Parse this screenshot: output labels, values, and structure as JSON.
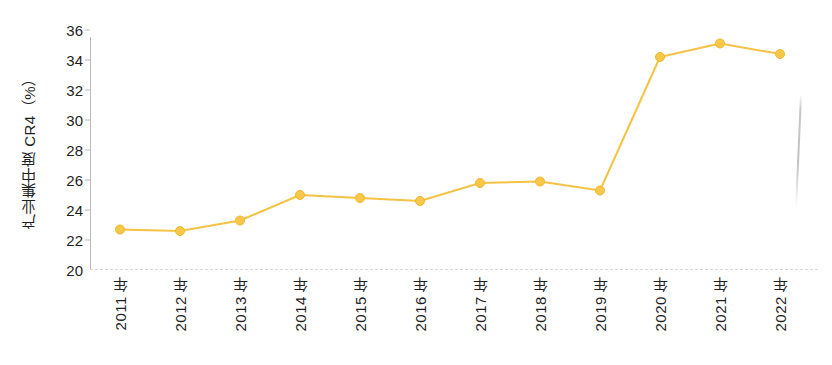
{
  "chart_data": {
    "type": "line",
    "title": "",
    "subtitle": "",
    "xlabel": "",
    "ylabel": "产业集中度 CR4（%）",
    "categories": [
      "2011 年",
      "2012 年",
      "2013 年",
      "2014 年",
      "2015 年",
      "2016 年",
      "2017 年",
      "2018 年",
      "2019 年",
      "2020 年",
      "2021 年",
      "2022 年"
    ],
    "values": [
      22.7,
      22.6,
      23.3,
      25.0,
      24.8,
      24.6,
      25.8,
      25.9,
      25.3,
      34.2,
      35.1,
      34.4
    ],
    "series": [
      {
        "name": "产业集中度 CR4",
        "values": [
          22.7,
          22.6,
          23.3,
          25.0,
          24.8,
          24.6,
          25.8,
          25.9,
          25.3,
          34.2,
          35.1,
          34.4
        ]
      }
    ],
    "ylim": [
      20,
      36
    ],
    "ytick_values": [
      20,
      22,
      24,
      26,
      28,
      30,
      32,
      34,
      36
    ],
    "ytick_labels": [
      "20",
      "22",
      "24",
      "26",
      "28",
      "30",
      "32",
      "34",
      "36"
    ],
    "ytick_step": 2,
    "xlim_categories": 12,
    "grid": false,
    "legend": null,
    "legend_position": "none",
    "marker": "circle",
    "marker_size": 9,
    "line_width": 2,
    "colors": {
      "line": "#F5C344",
      "marker_fill": "#F9C84A",
      "marker_edge": "#F2B72B",
      "axis": "#B9B9BD",
      "baseline": "#D8D8DC",
      "text": "#1F1F1F",
      "background": "#FFFFFF"
    },
    "annotations": []
  },
  "figure": {
    "title_remnant": "",
    "artifact_name": "scan-artifact"
  }
}
